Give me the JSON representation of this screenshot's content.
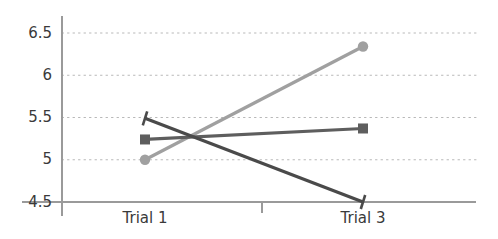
{
  "chart_data": {
    "type": "line",
    "title": "",
    "subtitle": "",
    "xlabel": "",
    "ylabel": "",
    "categories": [
      "Trial 1",
      "Trial 3"
    ],
    "x": [
      1,
      3
    ],
    "xlim": [
      0.55,
      3.75
    ],
    "ylim": [
      4.5,
      6.65
    ],
    "yticks": [
      4.5,
      5,
      5.5,
      6,
      6.5
    ],
    "ytick_labels": [
      "4.5",
      "5",
      "5.5",
      "6",
      "6.5"
    ],
    "xtick_labels": [
      "Trial 1",
      "Trial 3"
    ],
    "grid": "horizontal-dotted",
    "legend": "none",
    "series": [
      {
        "name": "series-light",
        "color": "#a0a0a0",
        "marker": "circle",
        "values": [
          5.0,
          6.34
        ]
      },
      {
        "name": "series-medium",
        "color": "#5e5e5e",
        "marker": "square",
        "values": [
          5.24,
          5.37
        ]
      },
      {
        "name": "series-dark",
        "color": "#4a4a4a",
        "marker": "tick",
        "values": [
          5.49,
          4.5
        ]
      }
    ],
    "axis_color": "#9a9a9a",
    "grid_color": "#b8b8b8",
    "background": "#ffffff"
  }
}
